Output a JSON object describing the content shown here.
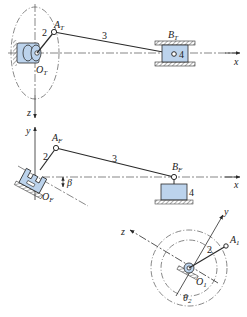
{
  "colors": {
    "ink": "#2a2a2a",
    "part_fill": "#bcd3ec",
    "ground": "#8a8a8a",
    "dashed": "#555555"
  },
  "top_view": {
    "crank_label": "2",
    "rod_label": "3",
    "slider_label": "4",
    "point_A": "A",
    "point_A_sub": "T",
    "point_B": "B",
    "point_B_sub": "T",
    "origin": "O",
    "origin_sub": "T",
    "axis_x": "x",
    "axis_z": "z"
  },
  "front_view": {
    "crank_label": "2",
    "rod_label": "3",
    "slider_label": "4",
    "point_A": "A",
    "point_A_sub": "F",
    "point_B": "B",
    "point_B_sub": "F",
    "origin": "O",
    "origin_sub": "F",
    "axis_x": "x",
    "axis_y": "y",
    "angle_label": "β"
  },
  "aux_view": {
    "crank_label": "2",
    "point_A": "A",
    "point_A_sub": "1",
    "origin": "O",
    "origin_sub": "1",
    "axis_y": "y",
    "axis_z": "z",
    "angle_label": "θ",
    "angle_sub": "2"
  }
}
